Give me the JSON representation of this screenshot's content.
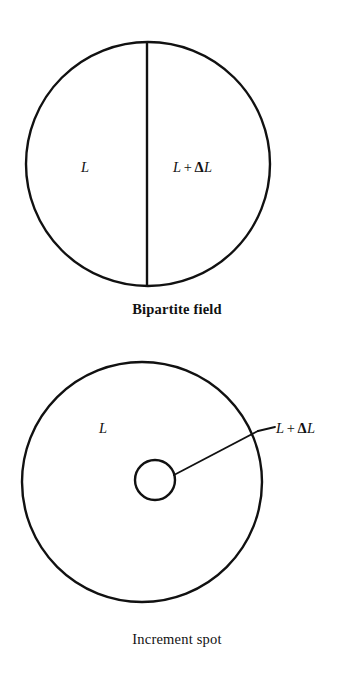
{
  "page": {
    "background_color": "#ffffff",
    "ink_color": "#111111",
    "width": 354,
    "height": 675
  },
  "figures": [
    {
      "id": "bipartite-field",
      "caption": "Bipartite field",
      "shape": "circle divided by a vertical diameter into two half fields",
      "labels": {
        "left": {
          "var": "L"
        },
        "right": {
          "var1": "L",
          "op": "+",
          "delta": "Δ",
          "var2": "L"
        }
      },
      "geometry": {
        "circle": {
          "cx": 148,
          "cy": 164,
          "r": 122
        },
        "divider": {
          "x": 147,
          "y1": 42,
          "y2": 286
        }
      }
    },
    {
      "id": "increment-spot",
      "caption": "Increment spot",
      "shape": "large circle with a small concentric-ish inner spot and a leader line to the outer edge",
      "labels": {
        "inner_field": {
          "var": "L"
        },
        "leader": {
          "var1": "L",
          "op": "+",
          "delta": "Δ",
          "var2": "L"
        }
      },
      "geometry": {
        "outer_circle": {
          "cx": 142,
          "cy": 147,
          "r": 120
        },
        "inner_circle": {
          "cx": 155,
          "cy": 145,
          "r": 20
        },
        "leader_line": {
          "x1": 174,
          "y1": 140,
          "x2": 258,
          "y2": 96,
          "stub_x2": 274,
          "stub_y2": 92
        }
      }
    }
  ]
}
